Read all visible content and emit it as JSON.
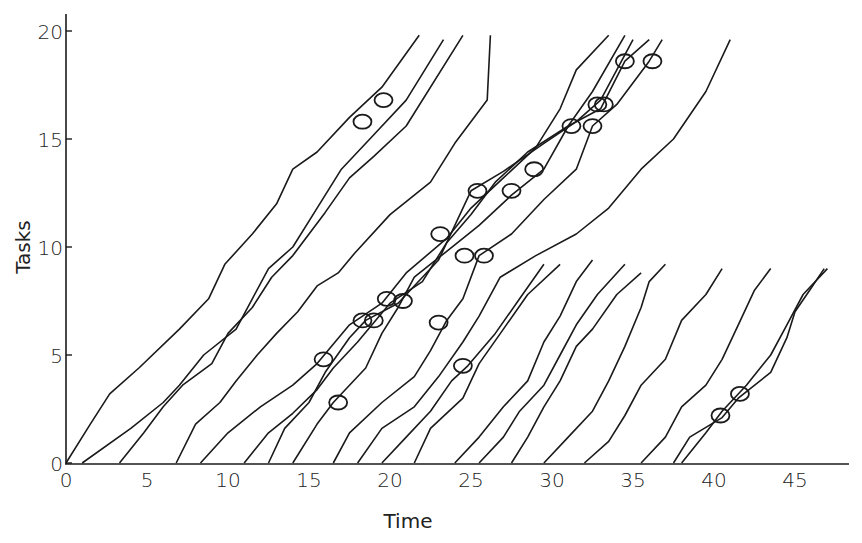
{
  "chart_data": {
    "type": "line",
    "title": "",
    "xlabel": "Time",
    "ylabel": "Tasks",
    "xlim": [
      0,
      48
    ],
    "ylim": [
      0,
      20
    ],
    "x_ticks": [
      0,
      5,
      10,
      15,
      20,
      25,
      30,
      35,
      40,
      45
    ],
    "y_ticks": [
      0,
      5,
      10,
      15,
      20
    ],
    "grid": false,
    "legend": null,
    "series": [
      {
        "name": "trace-1",
        "points": [
          [
            0,
            0
          ],
          [
            1.5,
            1.8
          ],
          [
            2.7,
            3.2
          ],
          [
            4.5,
            4.4
          ],
          [
            7,
            6.2
          ],
          [
            8.8,
            7.6
          ],
          [
            9.8,
            9.2
          ],
          [
            11.5,
            10.6
          ],
          [
            13,
            12
          ],
          [
            14,
            13.6
          ],
          [
            15.5,
            14.4
          ],
          [
            17.5,
            16
          ],
          [
            19.5,
            17.4
          ],
          [
            21.8,
            19.8
          ]
        ]
      },
      {
        "name": "trace-2",
        "points": [
          [
            1,
            0
          ],
          [
            4,
            1.6
          ],
          [
            6,
            2.8
          ],
          [
            7,
            3.6
          ],
          [
            8.5,
            5
          ],
          [
            10.5,
            6.2
          ],
          [
            11.5,
            7.6
          ],
          [
            12.5,
            9
          ],
          [
            14,
            10
          ],
          [
            15.5,
            11.8
          ],
          [
            17,
            13.6
          ],
          [
            19,
            15.2
          ],
          [
            21,
            16.8
          ],
          [
            23.3,
            19.6
          ]
        ]
      },
      {
        "name": "trace-3",
        "points": [
          [
            3.3,
            0
          ],
          [
            4.8,
            1.4
          ],
          [
            6,
            2.6
          ],
          [
            7.2,
            3.6
          ],
          [
            9,
            4.6
          ],
          [
            10,
            6
          ],
          [
            11.5,
            7.2
          ],
          [
            12.7,
            8.6
          ],
          [
            14,
            9.6
          ],
          [
            16,
            11.6
          ],
          [
            17.5,
            13.2
          ],
          [
            19,
            14.2
          ],
          [
            21,
            15.6
          ],
          [
            24.5,
            19.8
          ]
        ]
      },
      {
        "name": "trace-4",
        "points": [
          [
            6.8,
            0
          ],
          [
            8,
            1.8
          ],
          [
            9.5,
            2.8
          ],
          [
            10.5,
            3.8
          ],
          [
            11.8,
            5
          ],
          [
            13,
            6
          ],
          [
            14.3,
            7
          ],
          [
            15.5,
            8.2
          ],
          [
            16.8,
            8.8
          ],
          [
            17.8,
            9.7
          ],
          [
            20,
            11.5
          ],
          [
            22.5,
            13
          ],
          [
            24,
            14.8
          ],
          [
            26,
            16.8
          ],
          [
            26.2,
            19.8
          ]
        ]
      },
      {
        "name": "trace-5",
        "points": [
          [
            8.3,
            0
          ],
          [
            10,
            1.4
          ],
          [
            12,
            2.6
          ],
          [
            14,
            3.6
          ],
          [
            15.5,
            4.6
          ],
          [
            17.5,
            6.4
          ],
          [
            19.5,
            7.4
          ],
          [
            21,
            8.8
          ],
          [
            23.5,
            10.4
          ],
          [
            25,
            11.8
          ],
          [
            27,
            13.2
          ],
          [
            29,
            14.6
          ],
          [
            30.5,
            16.4
          ],
          [
            31.5,
            18.2
          ],
          [
            33.5,
            19.8
          ]
        ]
      },
      {
        "name": "trace-6",
        "points": [
          [
            11,
            0
          ],
          [
            12.5,
            1.4
          ],
          [
            14,
            2.3
          ],
          [
            15.5,
            3.4
          ],
          [
            16.5,
            4.4
          ],
          [
            18,
            5.6
          ],
          [
            20,
            7.4
          ],
          [
            22,
            8.4
          ],
          [
            23.5,
            10.2
          ],
          [
            25,
            11.5
          ],
          [
            26.5,
            13
          ],
          [
            28.5,
            14.4
          ],
          [
            31,
            15.6
          ],
          [
            32.5,
            17.2
          ],
          [
            34.5,
            19.8
          ]
        ]
      },
      {
        "name": "trace-7",
        "points": [
          [
            12.5,
            0
          ],
          [
            13.5,
            1.6
          ],
          [
            15,
            2.8
          ],
          [
            16,
            4.2
          ],
          [
            17.5,
            5.8
          ],
          [
            18.5,
            6.6
          ],
          [
            20.5,
            7.4
          ],
          [
            23,
            9.4
          ],
          [
            25,
            12.6
          ],
          [
            27,
            13.5
          ],
          [
            29.5,
            14.8
          ],
          [
            31.5,
            15.8
          ],
          [
            33,
            16.8
          ],
          [
            35,
            19.6
          ]
        ]
      },
      {
        "name": "trace-8",
        "points": [
          [
            14,
            0
          ],
          [
            15.5,
            1.8
          ],
          [
            16.5,
            2.8
          ],
          [
            18.5,
            4.4
          ],
          [
            19.5,
            6
          ],
          [
            20.5,
            7.2
          ],
          [
            21.5,
            8.6
          ],
          [
            23.5,
            9.8
          ],
          [
            25.5,
            11
          ],
          [
            27.5,
            12.4
          ],
          [
            29.5,
            13.6
          ],
          [
            31,
            15.6
          ],
          [
            33,
            16.4
          ],
          [
            34.5,
            18.6
          ],
          [
            36,
            19.6
          ]
        ]
      },
      {
        "name": "trace-9",
        "points": [
          [
            16.5,
            0
          ],
          [
            17.5,
            1.4
          ],
          [
            19.5,
            2.8
          ],
          [
            21.5,
            4
          ],
          [
            22.5,
            5.2
          ],
          [
            23.5,
            6.6
          ],
          [
            24.5,
            7.6
          ],
          [
            25.5,
            9.6
          ],
          [
            27.5,
            10.6
          ],
          [
            29.5,
            12.2
          ],
          [
            31.5,
            13.6
          ],
          [
            32.5,
            15.6
          ],
          [
            34,
            16.6
          ],
          [
            36,
            18.6
          ],
          [
            36.8,
            19.6
          ]
        ]
      },
      {
        "name": "trace-10",
        "points": [
          [
            18,
            0
          ],
          [
            19.5,
            1.6
          ],
          [
            21.5,
            2.6
          ],
          [
            23,
            4
          ],
          [
            24.5,
            5.6
          ],
          [
            25.5,
            6.8
          ],
          [
            26.8,
            8.6
          ],
          [
            29,
            9.6
          ],
          [
            31.5,
            10.6
          ],
          [
            33.5,
            11.8
          ],
          [
            35.5,
            13.6
          ],
          [
            37.5,
            15
          ],
          [
            39.5,
            17.2
          ],
          [
            41,
            19.6
          ]
        ]
      },
      {
        "name": "trace-11",
        "points": [
          [
            19.5,
            0
          ],
          [
            21,
            1.2
          ],
          [
            22.5,
            2.4
          ],
          [
            23.8,
            3.8
          ],
          [
            24.8,
            4.5
          ],
          [
            26.5,
            6
          ],
          [
            28,
            7.6
          ],
          [
            29.5,
            9.2
          ]
        ]
      },
      {
        "name": "trace-12",
        "points": [
          [
            21.5,
            0
          ],
          [
            22.5,
            1.6
          ],
          [
            24.5,
            3
          ],
          [
            25.5,
            4.6
          ],
          [
            27,
            6.2
          ],
          [
            28.5,
            7.8
          ],
          [
            30.5,
            9.2
          ]
        ]
      },
      {
        "name": "trace-13",
        "points": [
          [
            24,
            0
          ],
          [
            25.5,
            1.2
          ],
          [
            27,
            2.6
          ],
          [
            28.5,
            3.8
          ],
          [
            29.5,
            5.6
          ],
          [
            30.5,
            6.8
          ],
          [
            31.5,
            8.4
          ],
          [
            32.5,
            9.4
          ]
        ]
      },
      {
        "name": "trace-14",
        "points": [
          [
            25.5,
            0
          ],
          [
            27,
            1.2
          ],
          [
            28,
            2.4
          ],
          [
            29.5,
            3.6
          ],
          [
            30.5,
            5
          ],
          [
            31.5,
            6.4
          ],
          [
            32.8,
            7.8
          ],
          [
            34.5,
            9.2
          ]
        ]
      },
      {
        "name": "trace-15",
        "points": [
          [
            27.5,
            0
          ],
          [
            28.5,
            1.2
          ],
          [
            29.5,
            2.6
          ],
          [
            30.5,
            3.8
          ],
          [
            31.5,
            5.4
          ],
          [
            32.5,
            6.2
          ],
          [
            34,
            7.8
          ],
          [
            35.5,
            8.8
          ]
        ]
      },
      {
        "name": "trace-16",
        "points": [
          [
            29.5,
            0
          ],
          [
            31,
            1.2
          ],
          [
            32.5,
            2.4
          ],
          [
            33.5,
            3.8
          ],
          [
            34.5,
            5.4
          ],
          [
            35.5,
            7.2
          ],
          [
            36,
            8.4
          ],
          [
            37,
            9.2
          ]
        ]
      },
      {
        "name": "trace-17",
        "points": [
          [
            32,
            0
          ],
          [
            33.5,
            1
          ],
          [
            34.5,
            2.2
          ],
          [
            35.5,
            3.6
          ],
          [
            37,
            4.8
          ],
          [
            38,
            6.6
          ],
          [
            39.5,
            7.8
          ],
          [
            40.5,
            9.0
          ]
        ]
      },
      {
        "name": "trace-18",
        "points": [
          [
            35.5,
            0
          ],
          [
            37,
            1.2
          ],
          [
            38,
            2.6
          ],
          [
            39.5,
            3.6
          ],
          [
            40.5,
            4.8
          ],
          [
            41.5,
            6.4
          ],
          [
            42.5,
            8
          ],
          [
            43.5,
            9.0
          ]
        ]
      },
      {
        "name": "trace-19",
        "points": [
          [
            37.5,
            0
          ],
          [
            38.5,
            1.2
          ],
          [
            40.5,
            2.1
          ],
          [
            41.5,
            3
          ],
          [
            43.5,
            4.2
          ],
          [
            44.5,
            5.8
          ],
          [
            45,
            7
          ],
          [
            46,
            8.1
          ],
          [
            46.8,
            9.0
          ]
        ]
      },
      {
        "name": "trace-20",
        "points": [
          [
            38,
            0
          ],
          [
            39.5,
            1.4
          ],
          [
            40.5,
            2.4
          ],
          [
            42,
            3.6
          ],
          [
            43.5,
            5
          ],
          [
            44.5,
            6.4
          ],
          [
            45.5,
            7.8
          ],
          [
            47,
            9.0
          ]
        ]
      }
    ],
    "markers": [
      [
        18.3,
        15.8
      ],
      [
        19.6,
        16.8
      ],
      [
        15.9,
        4.8
      ],
      [
        16.8,
        2.8
      ],
      [
        18.3,
        6.6
      ],
      [
        19.0,
        6.6
      ],
      [
        19.8,
        7.6
      ],
      [
        20.8,
        7.5
      ],
      [
        23.1,
        10.6
      ],
      [
        23.0,
        6.5
      ],
      [
        25.4,
        12.6
      ],
      [
        24.6,
        9.6
      ],
      [
        25.8,
        9.6
      ],
      [
        24.5,
        4.5
      ],
      [
        27.5,
        12.6
      ],
      [
        28.9,
        13.6
      ],
      [
        31.2,
        15.6
      ],
      [
        32.5,
        15.6
      ],
      [
        32.8,
        16.6
      ],
      [
        33.2,
        16.6
      ],
      [
        34.5,
        18.6
      ],
      [
        36.2,
        18.6
      ],
      [
        40.4,
        2.2
      ],
      [
        41.6,
        3.2
      ]
    ]
  },
  "axes": {
    "x_title": "Time",
    "y_title": "Tasks",
    "x_tick_labels": [
      "0",
      "5",
      "10",
      "15",
      "20",
      "25",
      "30",
      "35",
      "40",
      "45"
    ],
    "y_tick_labels": [
      "0",
      "5",
      "10",
      "15",
      "20"
    ]
  }
}
